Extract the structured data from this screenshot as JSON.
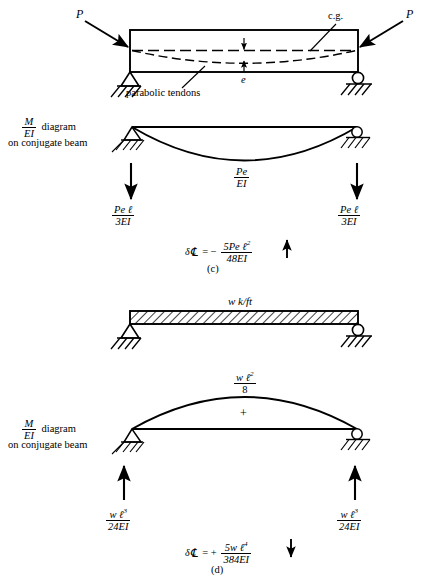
{
  "figure": {
    "panels": [
      "(c)",
      "(d)"
    ]
  },
  "panel_c": {
    "key": "(c)",
    "force_left_label": "P",
    "force_right_label": "P",
    "cg_label": "c.g.",
    "eccentricity_label": "e",
    "tendon_label": "parabolic tendons",
    "diagram_label_line1_num": "M",
    "diagram_label_line1_den": "EI",
    "diagram_label_line1_word": "diagram",
    "diagram_label_line2": "on conjugate beam",
    "moment_value_num": "Pe",
    "moment_value_den": "EI",
    "reaction_left_num": "Pe ℓ",
    "reaction_left_den": "3EI",
    "reaction_right_num": "Pe ℓ",
    "reaction_right_den": "3EI",
    "reaction_direction": "down",
    "deflection_symbol": "δ",
    "deflection_subscript": "℄",
    "deflection_eq": "= −",
    "deflection_num": "5Pe ℓ",
    "deflection_num_exp": "2",
    "deflection_den": "48EI",
    "deflection_arrow": "up"
  },
  "panel_d": {
    "key": "(d)",
    "load_label": "w k/ft",
    "diagram_label_line1_num": "M",
    "diagram_label_line1_den": "EI",
    "diagram_label_line1_word": "diagram",
    "diagram_label_line2": "on conjugate beam",
    "moment_value_num": "w ℓ",
    "moment_value_num_exp": "2",
    "moment_value_den": "8",
    "sign_label": "+",
    "reaction_left_num": "w ℓ",
    "reaction_left_num_exp": "3",
    "reaction_left_den": "24EI",
    "reaction_right_num": "w ℓ",
    "reaction_right_num_exp": "3",
    "reaction_right_den": "24EI",
    "reaction_direction": "up",
    "deflection_symbol": "δ",
    "deflection_subscript": "℄",
    "deflection_eq": "= +",
    "deflection_num": "5w ℓ",
    "deflection_num_exp": "4",
    "deflection_den": "384EI",
    "deflection_arrow": "down"
  },
  "colors": {
    "ink": "#000000",
    "paper": "#ffffff"
  }
}
